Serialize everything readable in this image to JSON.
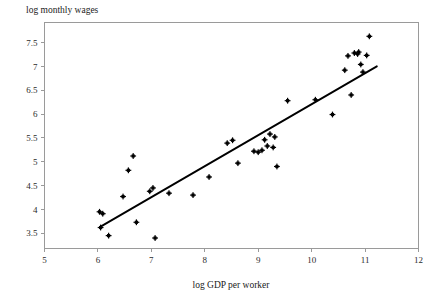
{
  "chart_data": {
    "type": "scatter",
    "title": "",
    "xlabel": "log GDP per worker",
    "ylabel": "log monthly wages",
    "xlim": [
      5,
      12
    ],
    "ylim": [
      3.18,
      7.92
    ],
    "grid": false,
    "legend": "none",
    "xticks": [
      "5",
      "6",
      "7",
      "8",
      "9",
      "10",
      "11",
      "12"
    ],
    "xtick_values": [
      5,
      6,
      7,
      8,
      9,
      10,
      11,
      12
    ],
    "yticks": [
      "3.5",
      "4",
      "4.5",
      "5",
      "5.5",
      "6",
      "6.5",
      "7",
      "7.5"
    ],
    "ytick_values": [
      3.5,
      4,
      4.5,
      5,
      5.5,
      6,
      6.5,
      7,
      7.5
    ],
    "series": [
      {
        "name": "countries",
        "marker": "plus-dot",
        "color": "#000000",
        "points": [
          [
            6.03,
            3.95
          ],
          [
            6.09,
            3.91
          ],
          [
            6.05,
            3.62
          ],
          [
            6.2,
            3.45
          ],
          [
            6.47,
            4.27
          ],
          [
            6.57,
            4.82
          ],
          [
            6.66,
            5.12
          ],
          [
            6.72,
            3.73
          ],
          [
            6.97,
            4.38
          ],
          [
            7.03,
            4.45
          ],
          [
            7.07,
            3.4
          ],
          [
            7.33,
            4.34
          ],
          [
            7.78,
            4.3
          ],
          [
            8.08,
            4.68
          ],
          [
            8.42,
            5.39
          ],
          [
            8.52,
            5.45
          ],
          [
            8.62,
            4.97
          ],
          [
            8.92,
            5.22
          ],
          [
            9.0,
            5.2
          ],
          [
            9.07,
            5.24
          ],
          [
            9.12,
            5.46
          ],
          [
            9.17,
            5.33
          ],
          [
            9.22,
            5.58
          ],
          [
            9.28,
            5.3
          ],
          [
            9.31,
            5.52
          ],
          [
            9.35,
            4.9
          ],
          [
            9.55,
            6.28
          ],
          [
            10.07,
            6.3
          ],
          [
            10.39,
            5.99
          ],
          [
            10.62,
            6.92
          ],
          [
            10.68,
            7.22
          ],
          [
            10.74,
            6.4
          ],
          [
            10.8,
            7.28
          ],
          [
            10.86,
            7.26
          ],
          [
            10.88,
            7.3
          ],
          [
            10.92,
            7.04
          ],
          [
            10.96,
            6.88
          ],
          [
            11.03,
            7.23
          ],
          [
            11.08,
            7.63
          ]
        ]
      }
    ],
    "fit_line": {
      "name": "regression-line",
      "color": "#000000",
      "x_start": 6.05,
      "y_start": 3.64,
      "x_end": 11.22,
      "y_end": 7.0
    }
  }
}
